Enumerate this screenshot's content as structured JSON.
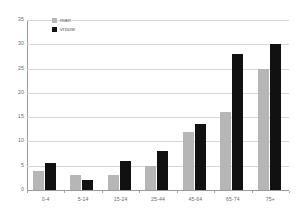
{
  "chart_data": {
    "type": "bar",
    "title": "",
    "subtitle": "",
    "xlabel": "",
    "ylabel": "",
    "categories": [
      "0-4",
      "5-14",
      "15-24",
      "25-44",
      "45-64",
      "65-74",
      "75+"
    ],
    "series": [
      {
        "name": "man",
        "color": "#b6b6b6",
        "values": [
          4,
          3,
          3,
          5,
          12,
          16,
          25
        ]
      },
      {
        "name": "vrouw",
        "color": "#111111",
        "values": [
          5.5,
          2,
          6,
          8,
          13.5,
          28,
          30
        ]
      }
    ],
    "ylim": [
      0,
      35
    ],
    "ytick_labels": [
      "0",
      "5",
      "10",
      "15",
      "20",
      "25",
      "30",
      "35"
    ],
    "ytick_values": [
      0,
      5,
      10,
      15,
      20,
      25,
      30,
      35
    ],
    "grid": true,
    "legend_position": "top-left",
    "annotations": []
  },
  "legend": {
    "entries": [
      {
        "label": "man",
        "swatch": "man-swatch"
      },
      {
        "label": "vrouw",
        "swatch": "vrouw-swatch"
      }
    ]
  },
  "colors": {
    "man": "#b6b6b6",
    "vrouw": "#111111",
    "gridline": "#d8d8d8",
    "axis": "#9a9a9a",
    "tick_text": "#6b6b6b",
    "background": "#ffffff"
  }
}
